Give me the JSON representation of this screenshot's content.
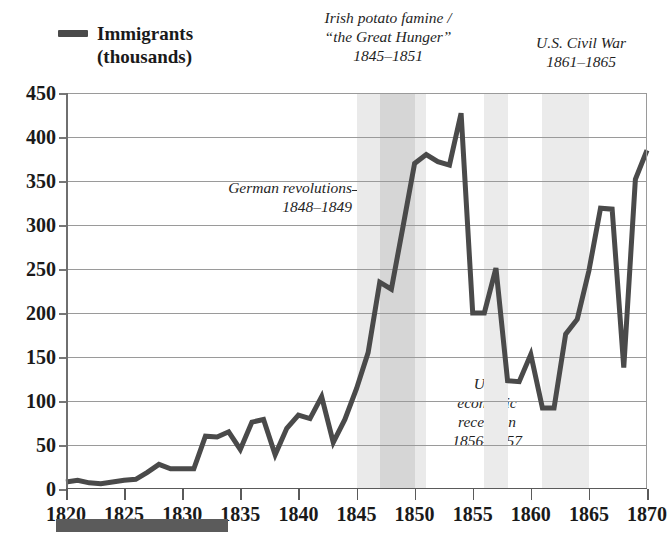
{
  "legend": {
    "label_line1": "Immigrants",
    "label_line2": "(thousands)",
    "color": "#4a4a4a"
  },
  "annotations": [
    {
      "id": "irish-famine",
      "line1": "Irish potato famine /",
      "line2": "“the Great Hunger”",
      "line3": "1845–1851",
      "start": 1845,
      "end": 1851
    },
    {
      "id": "us-civil-war",
      "line1": "U.S. Civil War",
      "line2": "1861–1865",
      "line3": "",
      "start": 1861,
      "end": 1865
    },
    {
      "id": "german-revolutions",
      "line1": "German revolutions",
      "line2": "1848–1849",
      "line3": "",
      "start": 1848,
      "end": 1849
    },
    {
      "id": "us-recession",
      "line1": "U.S.",
      "line2": "economic",
      "line3": "recession",
      "line4": "1856–1857",
      "start": 1856,
      "end": 1857
    }
  ],
  "bands": [
    {
      "id": "famine-outer",
      "start": 1845,
      "end": 1851,
      "color": "#eaeaea"
    },
    {
      "id": "famine-inner",
      "start": 1847,
      "end": 1850,
      "color": "#d6d6d6"
    },
    {
      "id": "recession",
      "start": 1856,
      "end": 1858,
      "color": "#ebebeb"
    },
    {
      "id": "civil-war",
      "start": 1861,
      "end": 1865,
      "color": "#ebebeb"
    }
  ],
  "chart_data": {
    "type": "line",
    "title": "",
    "subtitle": "",
    "xlabel": "",
    "ylabel": "Immigrants (thousands)",
    "xlim": [
      1820,
      1870
    ],
    "ylim": [
      0,
      450
    ],
    "ytick_labels": [
      "0",
      "50",
      "100",
      "150",
      "200",
      "250",
      "300",
      "350",
      "400",
      "450"
    ],
    "yticks": [
      0,
      50,
      100,
      150,
      200,
      250,
      300,
      350,
      400,
      450
    ],
    "xtick_labels": [
      "1820",
      "1825",
      "1830",
      "1835",
      "1840",
      "1845",
      "1850",
      "1855",
      "1860",
      "1865",
      "1870"
    ],
    "xticks": [
      1820,
      1825,
      1830,
      1835,
      1840,
      1845,
      1850,
      1855,
      1860,
      1865,
      1870
    ],
    "grid": true,
    "legend_position": "top-left",
    "line_color": "#4a4a4a",
    "line_width": 5,
    "series": [
      {
        "name": "Immigrants (thousands)",
        "x": [
          1820,
          1821,
          1822,
          1823,
          1824,
          1825,
          1826,
          1827,
          1828,
          1829,
          1830,
          1831,
          1832,
          1833,
          1834,
          1835,
          1836,
          1837,
          1838,
          1839,
          1840,
          1841,
          1842,
          1843,
          1844,
          1845,
          1846,
          1847,
          1848,
          1849,
          1850,
          1851,
          1852,
          1853,
          1854,
          1855,
          1856,
          1857,
          1858,
          1859,
          1860,
          1861,
          1862,
          1863,
          1864,
          1865,
          1866,
          1867,
          1868,
          1869,
          1870
        ],
        "values": [
          8,
          10,
          7,
          6,
          8,
          10,
          11,
          19,
          28,
          23,
          23,
          23,
          60,
          59,
          65,
          45,
          76,
          79,
          39,
          69,
          84,
          80,
          105,
          53,
          79,
          114,
          155,
          235,
          227,
          298,
          370,
          380,
          372,
          368,
          427,
          200,
          200,
          251,
          123,
          122,
          153,
          92,
          92,
          176,
          193,
          248,
          319,
          318,
          138,
          352,
          385
        ]
      }
    ]
  },
  "footer": {
    "bar_color": "#5b5b5b"
  }
}
